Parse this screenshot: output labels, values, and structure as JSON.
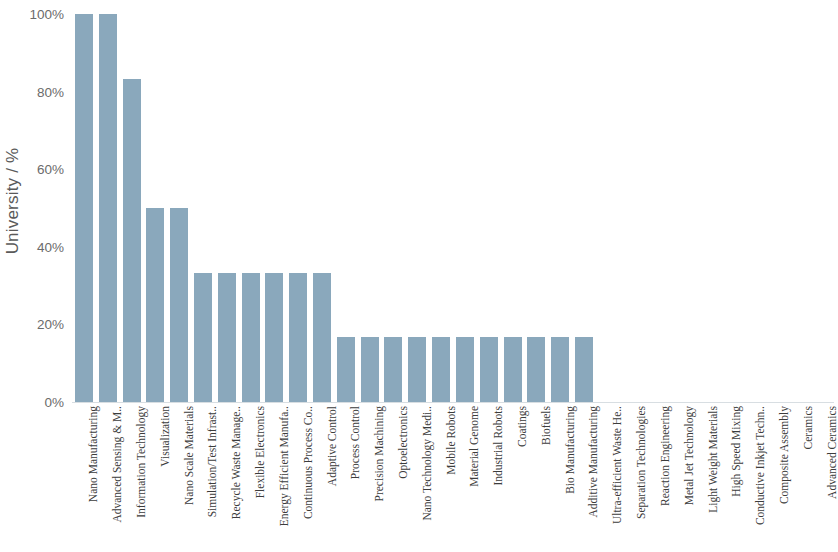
{
  "chart_data": {
    "type": "bar",
    "title": "",
    "subtitle": "",
    "xlabel": "",
    "ylabel": "University / %",
    "ylim": [
      0,
      100
    ],
    "ytick_labels": [
      "100%",
      "80%",
      "60%",
      "40%",
      "20%",
      "0%"
    ],
    "ytick_values": [
      100,
      80,
      60,
      40,
      20,
      0
    ],
    "grid": false,
    "legend": null,
    "bar_color": "#8aa8bc",
    "categories": [
      "Nano Manufacturing",
      "Advanced Sensing & M..",
      "Information Technology",
      "Visualization",
      "Nano Scale Materials",
      "Simulation/Test Infrast..",
      "Recycle Waste Manage..",
      "Flexible Electronics",
      "Energy Efficient Manufa..",
      "Continuous Process Co..",
      "Adaptive Control",
      "Process Control",
      "Precision Machining",
      "Optoelectronics",
      "Nano Technology Medi..",
      "Mobile Robots",
      "Material Genome",
      "Industrial Robots",
      "Coatings",
      "Biofuels",
      "Bio Manufacturing",
      "Additive Manufacturing",
      "Ultra-efficient Waste He..",
      "Separation Technologies",
      "Reaction Engineering",
      "Metal Jet Technology",
      "Light Weight Materials",
      "High Speed Mixing",
      "Conductive Inkjet Techn..",
      "Composite Assembly",
      "Ceramics",
      "Advanced Ceramics"
    ],
    "values": [
      100,
      100,
      83.3,
      50,
      50,
      33.3,
      33.3,
      33.3,
      33.3,
      33.3,
      33.3,
      16.7,
      16.7,
      16.7,
      16.7,
      16.7,
      16.7,
      16.7,
      16.7,
      16.7,
      16.7,
      16.7,
      0,
      0,
      0,
      0,
      0,
      0,
      0,
      0,
      0,
      0
    ]
  }
}
